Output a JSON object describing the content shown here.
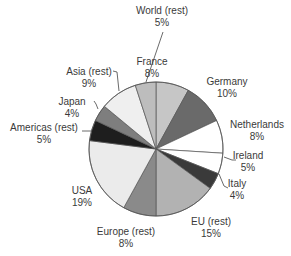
{
  "chart_data": {
    "type": "pie",
    "title": "",
    "start_angle_deg": 0,
    "direction": "clockwise",
    "center": [
      156,
      149
    ],
    "radius": 67,
    "slices": [
      {
        "label": "France",
        "value": 8,
        "pct_label": "8%",
        "color": "#c6c6c6",
        "label_pos": [
          152,
          56
        ],
        "leader": null
      },
      {
        "label": "Germany",
        "value": 10,
        "pct_label": "10%",
        "color": "#6a6a6a",
        "label_pos": [
          227,
          76
        ],
        "leader": null
      },
      {
        "label": "Netherlands",
        "value": 8,
        "pct_label": "8%",
        "color": "#ffffff",
        "label_pos": [
          257,
          119
        ],
        "leader": null
      },
      {
        "label": "Ireland",
        "value": 5,
        "pct_label": "5%",
        "color": "#ffffff",
        "label_pos": [
          248,
          150
        ],
        "leader": [
          [
            224,
            157
          ],
          [
            232,
            160
          ],
          [
            236,
            160
          ]
        ]
      },
      {
        "label": "Italy",
        "value": 4,
        "pct_label": "4%",
        "color": "#3a3a3a",
        "label_pos": [
          237,
          178
        ],
        "leader": [
          [
            219,
            174
          ],
          [
            224,
            186
          ],
          [
            228,
            188
          ]
        ]
      },
      {
        "label": "EU (rest)",
        "value": 15,
        "pct_label": "15%",
        "color": "#b2b2b2",
        "label_pos": [
          211,
          216
        ],
        "leader": null
      },
      {
        "label": "Europe (rest)",
        "value": 8,
        "pct_label": "8%",
        "color": "#8a8a8a",
        "label_pos": [
          126,
          226
        ],
        "leader": null
      },
      {
        "label": "USA",
        "value": 19,
        "pct_label": "19%",
        "color": "#ebebeb",
        "label_pos": [
          82,
          185
        ],
        "leader": null
      },
      {
        "label": "Americas (rest)",
        "value": 5,
        "pct_label": "5%",
        "color": "#1e1e1e",
        "label_pos": [
          44,
          122
        ],
        "leader": [
          [
            82,
            131
          ],
          [
            91,
            131
          ],
          [
            92,
            132
          ]
        ]
      },
      {
        "label": "Japan",
        "value": 4,
        "pct_label": "4%",
        "color": "#7e7e7e",
        "label_pos": [
          72,
          96
        ],
        "leader": [
          [
            94,
            101
          ],
          [
            96,
            104
          ],
          [
            98,
            109
          ]
        ]
      },
      {
        "label": "Asia (rest)",
        "value": 9,
        "pct_label": "9%",
        "color": "#efefef",
        "label_pos": [
          89,
          66
        ],
        "leader": [
          [
            113,
            71
          ],
          [
            117,
            72
          ],
          [
            119,
            91
          ]
        ]
      },
      {
        "label": "World (rest)",
        "value": 5,
        "pct_label": "5%",
        "color": "#bdbdbd",
        "label_pos": [
          162,
          5
        ],
        "leader": [
          [
            163,
            32
          ],
          [
            146,
            82
          ]
        ]
      }
    ]
  }
}
